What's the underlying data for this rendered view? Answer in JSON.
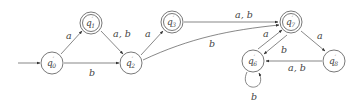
{
  "diagram": {
    "type": "finite-automaton",
    "start_state": "q0",
    "states": [
      {
        "id": "q0",
        "name": "q",
        "prime": "′",
        "sub": "0",
        "accepting": false
      },
      {
        "id": "q1",
        "name": "q",
        "prime": "′",
        "sub": "1",
        "accepting": true
      },
      {
        "id": "q2",
        "name": "q",
        "prime": "′",
        "sub": "2",
        "accepting": false
      },
      {
        "id": "q3",
        "name": "q",
        "prime": "′",
        "sub": "3",
        "accepting": true
      },
      {
        "id": "q7",
        "name": "q",
        "prime": "′",
        "sub": "7",
        "accepting": true
      },
      {
        "id": "q6",
        "name": "q",
        "prime": "′",
        "sub": "6",
        "accepting": false
      },
      {
        "id": "q8",
        "name": "q",
        "prime": "′",
        "sub": "8",
        "accepting": false
      }
    ],
    "transitions": [
      {
        "from": "q0",
        "to": "q1",
        "label": "a"
      },
      {
        "from": "q0",
        "to": "q2",
        "label": "b"
      },
      {
        "from": "q1",
        "to": "q2",
        "label": "a, b"
      },
      {
        "from": "q2",
        "to": "q3",
        "label": "a"
      },
      {
        "from": "q2",
        "to": "q7",
        "label": "b"
      },
      {
        "from": "q3",
        "to": "q7",
        "label": "a, b"
      },
      {
        "from": "q7",
        "to": "q8",
        "label": "a"
      },
      {
        "from": "q7",
        "to": "q6",
        "label": "b"
      },
      {
        "from": "q6",
        "to": "q7",
        "label": "a"
      },
      {
        "from": "q6",
        "to": "q6",
        "label": "b"
      },
      {
        "from": "q8",
        "to": "q6",
        "label": "a, b"
      }
    ]
  }
}
